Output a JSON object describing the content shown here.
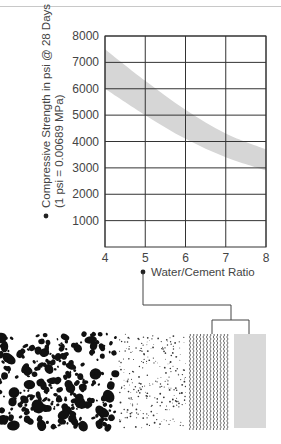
{
  "chart_data": {
    "type": "area",
    "title": "",
    "ylabel": "Compressive Strength in psi @ 28 Days",
    "ylabel_sub": "(1 psi = 0.00689 MPa)",
    "xlabel": "Water/Cement Ratio",
    "x": [
      4,
      5,
      6,
      7,
      8
    ],
    "xlim": [
      4,
      8
    ],
    "ylim": [
      0,
      8000
    ],
    "x_ticks": [
      "4",
      "5",
      "6",
      "7",
      "8"
    ],
    "y_ticks": [
      "1000",
      "2000",
      "3000",
      "4000",
      "5000",
      "6000",
      "7000",
      "8000"
    ],
    "grid": true,
    "legend": null,
    "series": [
      {
        "name": "Upper bound",
        "values": [
          7500,
          6300,
          5200,
          4300,
          3700
        ]
      },
      {
        "name": "Lower bound",
        "values": [
          6000,
          5000,
          4100,
          3400,
          2900
        ]
      }
    ],
    "band_color": "#d6d6d6",
    "grid_color": "#333333"
  },
  "illustration": {
    "panels": [
      {
        "name": "coarse-aggregate-texture",
        "pattern": "blotches"
      },
      {
        "name": "fine-aggregate-texture",
        "pattern": "speckles"
      },
      {
        "name": "water-texture",
        "pattern": "wavy-lines"
      },
      {
        "name": "cement-texture",
        "pattern": "solid-gray"
      }
    ]
  }
}
